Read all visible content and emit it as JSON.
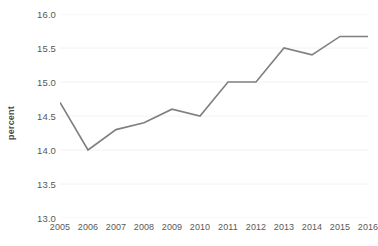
{
  "chart_data": {
    "type": "line",
    "title": "",
    "xlabel": "",
    "ylabel": "percent",
    "categories": [
      "2005",
      "2006",
      "2007",
      "2008",
      "2009",
      "2010",
      "2011",
      "2012",
      "2013",
      "2014",
      "2015",
      "2016"
    ],
    "values": [
      14.7,
      14.0,
      14.3,
      14.4,
      14.6,
      14.5,
      15.0,
      15.0,
      15.5,
      15.4,
      15.67,
      15.67
    ],
    "series": [
      {
        "name": "percent",
        "values": [
          14.7,
          14.0,
          14.3,
          14.4,
          14.6,
          14.5,
          15.0,
          15.0,
          15.5,
          15.4,
          15.67,
          15.67
        ]
      }
    ],
    "ylim": [
      13.0,
      16.0
    ],
    "ytick_labels": [
      "16.0",
      "15.5",
      "15.0",
      "14.5",
      "14.0",
      "13.5",
      "13.0"
    ],
    "ytick_values": [
      16.0,
      15.5,
      15.0,
      14.5,
      14.0,
      13.5,
      13.0
    ],
    "xtick_labels": [
      "2005",
      "2006",
      "2007",
      "2008",
      "2009",
      "2010",
      "2011",
      "2012",
      "2013",
      "2014",
      "2015",
      "2016"
    ],
    "grid": true,
    "grid_axis": "y",
    "legend": false,
    "legend_position": "none",
    "line_color": "#7f7f7f",
    "grid_color": "#f2f2f2",
    "tick_label_color": "#595959",
    "axis_title_color": "#4a4a4a",
    "background_color": "#ffffff"
  }
}
